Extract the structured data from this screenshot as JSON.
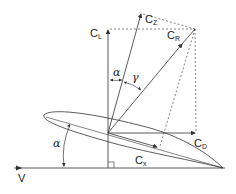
{
  "diagram": {
    "stroke_color": "#333333",
    "labels": {
      "cl": {
        "main": "C",
        "sub": "L"
      },
      "cz": {
        "main": "C",
        "sub": "Z"
      },
      "cr": {
        "main": "C",
        "sub": "R"
      },
      "cd": {
        "main": "C",
        "sub": "D"
      },
      "cx": {
        "main": "C",
        "sub": "x"
      },
      "v": "V",
      "alpha_top": "α",
      "gamma": "γ",
      "alpha_left": "α"
    }
  }
}
